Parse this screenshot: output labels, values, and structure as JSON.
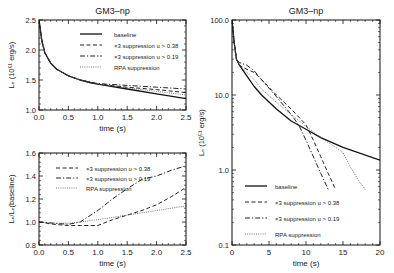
{
  "figure": {
    "panels": [
      {
        "id": "top-left",
        "title": "GM3–np",
        "xlabel": "time (s)",
        "ylabel": "Lₑ (10⁵¹ erg/s)"
      },
      {
        "id": "bottom-left",
        "title": "",
        "xlabel": "time (s)",
        "ylabel": "Lₑ/Lₑ(baseline)"
      },
      {
        "id": "right",
        "title": "GM3–np",
        "xlabel": "time (s)",
        "ylabel": "Lₑ (10⁵¹ erg/s)"
      }
    ]
  },
  "chart_data": [
    {
      "type": "line",
      "title": "GM3-np",
      "xlabel": "time (s)",
      "ylabel": "L_e (10^51 erg/s)",
      "xlim": [
        0,
        2.5
      ],
      "ylim": [
        1.0,
        2.5
      ],
      "xticks": [
        "0.0",
        "0.5",
        "1.0",
        "1.5",
        "2.0",
        "2.5"
      ],
      "yticks": [
        "1.0",
        "1.5",
        "2.0",
        "2.5"
      ],
      "legend_position": "upper right",
      "x": [
        0.0,
        0.05,
        0.1,
        0.2,
        0.3,
        0.5,
        0.7,
        0.9,
        1.0,
        1.5,
        2.0,
        2.5
      ],
      "series": [
        {
          "name": "baseline",
          "style": "solid",
          "values": [
            2.5,
            2.15,
            1.95,
            1.78,
            1.68,
            1.57,
            1.5,
            1.45,
            1.43,
            1.35,
            1.27,
            1.19
          ]
        },
        {
          "name": "x3 suppression u > 0.38",
          "style": "dashed",
          "values": [
            2.5,
            2.15,
            1.95,
            1.78,
            1.68,
            1.57,
            1.5,
            1.45,
            1.43,
            1.38,
            1.34,
            1.29
          ]
        },
        {
          "name": "x3 suppression u > 0.19",
          "style": "dashdot",
          "values": [
            2.5,
            2.15,
            1.95,
            1.78,
            1.68,
            1.57,
            1.5,
            1.46,
            1.44,
            1.41,
            1.38,
            1.35
          ]
        },
        {
          "name": "RPA suppression",
          "style": "dotted",
          "values": [
            2.5,
            2.15,
            1.95,
            1.78,
            1.68,
            1.57,
            1.5,
            1.45,
            1.43,
            1.37,
            1.31,
            1.25
          ]
        }
      ]
    },
    {
      "type": "line",
      "title": "",
      "xlabel": "time (s)",
      "ylabel": "L_e/L_e(baseline)",
      "xlim": [
        0,
        2.5
      ],
      "ylim": [
        0.8,
        1.6
      ],
      "xticks": [
        "0.0",
        "0.5",
        "1.0",
        "1.5",
        "2.0",
        "2.5"
      ],
      "yticks": [
        "0.8",
        "1.0",
        "1.2",
        "1.4",
        "1.6"
      ],
      "legend_position": "upper left",
      "x": [
        0.0,
        0.25,
        0.5,
        0.7,
        1.0,
        1.25,
        1.5,
        1.75,
        2.0,
        2.25,
        2.5
      ],
      "series": [
        {
          "name": "x3 suppression u > 0.38",
          "style": "dashed",
          "values": [
            1.0,
            0.98,
            0.97,
            0.97,
            0.97,
            1.02,
            1.06,
            1.1,
            1.15,
            1.22,
            1.3
          ]
        },
        {
          "name": "x3 suppression u > 0.19",
          "style": "dashdot",
          "values": [
            1.0,
            0.99,
            0.98,
            1.0,
            1.1,
            1.2,
            1.29,
            1.37,
            1.4,
            1.45,
            1.49
          ]
        },
        {
          "name": "RPA suppression",
          "style": "dotted",
          "values": [
            1.0,
            0.99,
            0.99,
            1.0,
            1.02,
            1.04,
            1.06,
            1.08,
            1.1,
            1.12,
            1.14
          ]
        }
      ]
    },
    {
      "type": "line",
      "title": "GM3-np",
      "xlabel": "time (s)",
      "ylabel": "L_e (10^51 erg/s)",
      "yscale": "log",
      "xlim": [
        0,
        20
      ],
      "ylim": [
        0.1,
        100.0
      ],
      "xticks": [
        "0",
        "5",
        "10",
        "15",
        "20"
      ],
      "yticks": [
        "0.1",
        "1.0",
        "10.0",
        "100.0"
      ],
      "legend_position": "lower left",
      "series": [
        {
          "name": "baseline",
          "style": "solid",
          "x": [
            0,
            0.3,
            0.6,
            1,
            2,
            3,
            4,
            6,
            8,
            10,
            12,
            15,
            20
          ],
          "values": [
            100,
            50,
            30,
            25,
            18,
            13,
            10,
            6.5,
            4.5,
            3.5,
            2.7,
            2.0,
            1.35
          ]
        },
        {
          "name": "x3 suppression u > 0.38",
          "style": "dashed",
          "x": [
            0,
            0.3,
            0.6,
            1,
            2,
            3,
            4,
            6,
            8,
            10,
            11,
            12,
            13,
            14
          ],
          "values": [
            100,
            50,
            30,
            25,
            22,
            20,
            16,
            10,
            6.5,
            4.0,
            2.5,
            1.5,
            0.9,
            0.55
          ]
        },
        {
          "name": "x3 suppression u > 0.19",
          "style": "dashdot",
          "x": [
            0,
            0.3,
            0.6,
            1,
            2,
            3,
            4,
            6,
            8,
            9,
            10,
            11,
            12,
            13
          ],
          "values": [
            100,
            50,
            30,
            27,
            25,
            21,
            16,
            9.5,
            5.5,
            4.0,
            2.5,
            1.5,
            0.9,
            0.55
          ]
        },
        {
          "name": "RPA suppression",
          "style": "dotted",
          "x": [
            0,
            0.3,
            0.6,
            1,
            2,
            3,
            4,
            6,
            8,
            10,
            12,
            14,
            15,
            16,
            17,
            18
          ],
          "values": [
            100,
            50,
            30,
            25,
            20,
            16,
            12,
            8.0,
            5.5,
            3.8,
            2.7,
            2.0,
            1.7,
            1.1,
            0.75,
            0.55
          ]
        }
      ]
    }
  ]
}
